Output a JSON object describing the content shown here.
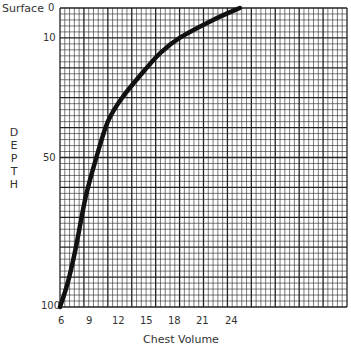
{
  "chart_data": {
    "type": "line",
    "title": "",
    "xlabel": "Chest Volume",
    "ylabel": "DEPTH",
    "y_top_label": "Surface",
    "x_ticks": [
      6,
      9,
      12,
      15,
      18,
      21,
      24
    ],
    "y_ticks": [
      0,
      10,
      50,
      100
    ],
    "xlim": [
      6,
      36
    ],
    "ylim": [
      100,
      0
    ],
    "y_inverted": true,
    "grid": true,
    "series": [
      {
        "name": "Chest volume vs depth",
        "x": [
          24.8,
          22,
          18.5,
          16.5,
          14.8,
          12.5,
          11,
          9.8,
          8.7,
          7.6,
          6.8,
          6
        ],
        "y": [
          0,
          4,
          10,
          15,
          21,
          30,
          38,
          50,
          63,
          81,
          92,
          100
        ]
      }
    ]
  },
  "labels": {
    "surface": "Surface",
    "xlabel": "Chest Volume",
    "ylabel_letters": [
      "D",
      "E",
      "P",
      "T",
      "H"
    ],
    "x_ticks": [
      "6",
      "9",
      "12",
      "15",
      "18",
      "21",
      "24"
    ],
    "y_ticks": [
      "0",
      "10",
      "50",
      "100"
    ]
  }
}
